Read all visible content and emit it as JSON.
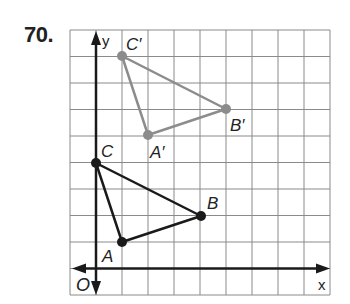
{
  "problem": {
    "number": "70."
  },
  "grid": {
    "left": 70,
    "top": 30,
    "right": 330,
    "bottom": 295,
    "cols": 10,
    "rows": 10,
    "origin_col": 1,
    "origin_row_from_bottom": 1,
    "line_color": "#8a8a8a"
  },
  "axes": {
    "x_label": "x",
    "y_label": "y",
    "origin_label": "O",
    "color": "#1a1a1a"
  },
  "triangles": [
    {
      "name": "ABC",
      "color": "#1a1a1a",
      "vertices": [
        {
          "label": "A",
          "x": 1,
          "y": 1
        },
        {
          "label": "B",
          "x": 4,
          "y": 2
        },
        {
          "label": "C",
          "x": 0,
          "y": 4
        }
      ]
    },
    {
      "name": "A'B'C'",
      "color": "#8c8c8c",
      "vertices": [
        {
          "label": "A′",
          "x": 2,
          "y": 5
        },
        {
          "label": "B′",
          "x": 5,
          "y": 6
        },
        {
          "label": "C′",
          "x": 1,
          "y": 8
        }
      ]
    }
  ],
  "labels": {
    "A": "A",
    "B": "B",
    "C": "C",
    "A_prime": "A′",
    "B_prime": "B′",
    "C_prime": "C′"
  }
}
